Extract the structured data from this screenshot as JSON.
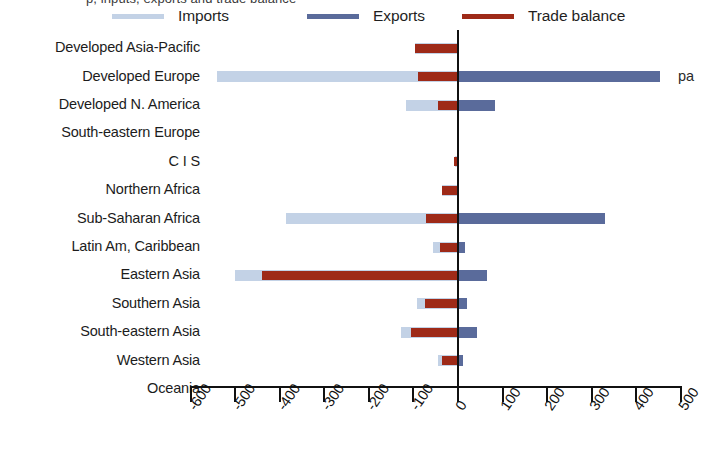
{
  "caption_clipped": "p, inputs, exports and trade balance",
  "right_clipped_text": "pa",
  "colors": {
    "imports": "#c3d2e6",
    "exports": "#5a6b9b",
    "balance": "#9e2a18",
    "axis": "#111111",
    "text": "#1c1c1c"
  },
  "legend": {
    "items": [
      {
        "label": "Imports",
        "color_key": "imports",
        "icon": "line-swatch-icon"
      },
      {
        "label": "Exports",
        "color_key": "exports",
        "icon": "line-swatch-icon"
      },
      {
        "label": "Trade balance",
        "color_key": "balance",
        "icon": "line-swatch-icon"
      }
    ]
  },
  "chart_data": {
    "type": "bar",
    "orientation": "horizontal",
    "title": "",
    "subtitle": "",
    "xlabel": "",
    "ylabel": "",
    "xlim": [
      -600,
      500
    ],
    "xticks": [
      -600,
      -500,
      -400,
      -300,
      -200,
      -100,
      0,
      100,
      200,
      300,
      400,
      500
    ],
    "xtick_labels": [
      "-600",
      "-500",
      "-400",
      "-300",
      "-200",
      "-100",
      "0",
      "100",
      "200",
      "300",
      "400",
      "500"
    ],
    "grid": false,
    "legend_position": "top",
    "categories": [
      "Developed Asia-Pacific",
      "Developed Europe",
      "Developed N. America",
      "South-eastern Europe",
      "C I S",
      "Northern Africa",
      "Sub-Saharan Africa",
      "Latin Am, Caribbean",
      "Eastern Asia",
      "Southern Asia",
      "South-eastern Asia",
      "Western Asia",
      "Oceania"
    ],
    "series": [
      {
        "name": "Imports",
        "color_key": "imports",
        "values": [
          -96,
          -540,
          -117,
          0,
          -6,
          -36,
          -385,
          -57,
          -500,
          -92,
          -127,
          -46,
          0
        ]
      },
      {
        "name": "Exports",
        "color_key": "exports",
        "values": [
          2,
          453,
          83,
          0,
          1,
          2,
          330,
          16,
          66,
          21,
          42,
          12,
          0
        ]
      },
      {
        "name": "Trade balance",
        "color_key": "balance",
        "values": [
          -96,
          -90,
          -45,
          0,
          -8,
          -35,
          -72,
          -40,
          -440,
          -75,
          -105,
          -36,
          0
        ]
      }
    ]
  }
}
